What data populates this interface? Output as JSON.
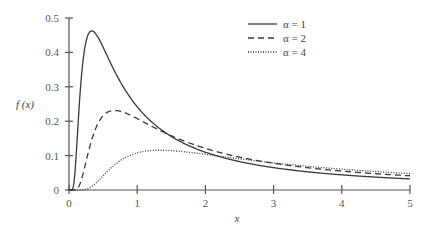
{
  "chart_data": {
    "type": "line",
    "title": "",
    "xlabel": "x",
    "ylabel": "f (x)",
    "xlim": [
      0,
      5
    ],
    "ylim": [
      0,
      0.5
    ],
    "grid": false,
    "legend_position": "upper right",
    "x_ticks": [
      "0",
      "1",
      "2",
      "3",
      "4",
      "5"
    ],
    "y_ticks": [
      "0",
      "0.1",
      "0.2",
      "0.3",
      "0.4",
      "0.5"
    ],
    "x": [
      0.1,
      0.2,
      0.33,
      0.5,
      0.75,
      1,
      1.5,
      2,
      2.5,
      3,
      3.5,
      4,
      4.5,
      5
    ],
    "series": [
      {
        "name": "α = 1",
        "alpha": 1,
        "line_style": "solid",
        "values": [
          0.085,
          0.366,
          0.462,
          0.415,
          0.315,
          0.242,
          0.156,
          0.11,
          0.083,
          0.065,
          0.053,
          0.044,
          0.037,
          0.032
        ]
      },
      {
        "name": "α = 2",
        "alpha": 2,
        "line_style": "dashed",
        "values": [
          0.001,
          0.043,
          0.146,
          0.216,
          0.229,
          0.208,
          0.158,
          0.121,
          0.096,
          0.078,
          0.065,
          0.055,
          0.047,
          0.041
        ]
      },
      {
        "name": "α = 4",
        "alpha": 4,
        "line_style": "dotted",
        "values": [
          0.0,
          0.0,
          0.01,
          0.041,
          0.085,
          0.108,
          0.115,
          0.104,
          0.091,
          0.079,
          0.069,
          0.061,
          0.054,
          0.048
        ]
      }
    ]
  },
  "legend": {
    "items": [
      {
        "label": "α = 1",
        "style": "solid"
      },
      {
        "label": "α = 2",
        "style": "dashed"
      },
      {
        "label": "α = 4",
        "style": "dotted"
      }
    ]
  },
  "colors": {
    "line": "#3a3a3a",
    "axis": "#555555",
    "text": "#555555"
  }
}
